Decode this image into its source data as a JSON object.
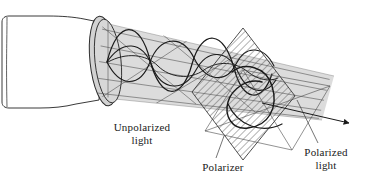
{
  "figure": {
    "background_color": "#ffffff",
    "width": 378,
    "height": 191
  },
  "labels": {
    "unpolarized": {
      "line1": "Unpolarized",
      "line2": "light"
    },
    "polarizer": {
      "line1": "Polarizer"
    },
    "polarized": {
      "line1": "Polarized",
      "line2": "light"
    }
  },
  "colors": {
    "ink": "#1a1a1a",
    "line": "#333333",
    "beam_fill": "#dcdcdc",
    "lamp_fill": "#ffffff",
    "hatch": "#555555",
    "aperture_fill": "#d2d2d2"
  },
  "elements": {
    "lamp": "flashlight-body",
    "beam": "unpolarized-light-beam",
    "aperture": "lamp-aperture-ellipse",
    "waves_unpolarized": "multiple-oriented-sine-waves",
    "polarizer": "hatched-polarizing-filter-square",
    "wave_polarized": "single-plane-sine-wave",
    "plane_polarized": "polarization-plane-parallelogram",
    "arrow": "propagation-direction-arrow",
    "leader_polarized": "leader-line-to-polarized-light-label",
    "leader_polarizer": "leader-line-to-polarizer-label"
  }
}
